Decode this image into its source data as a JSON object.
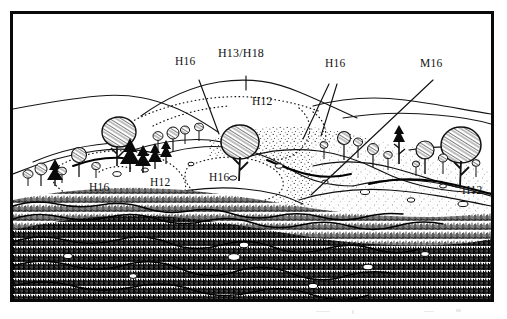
{
  "figure": {
    "kind": "habitat-survey-landscape-sketch",
    "medium": "pen-and-ink line drawing",
    "border_color": "#0a0a0a",
    "ink_color": "#111111",
    "paper_color": "#ffffff"
  },
  "labels": [
    {
      "id": "h16-ridge",
      "text": "H16",
      "x": 175,
      "y": 56,
      "leader": "line-down-right"
    },
    {
      "id": "h13-h18-summit",
      "text": "H13/H18",
      "x": 218,
      "y": 47,
      "leader": "tick-down"
    },
    {
      "id": "h12-upper",
      "text": "H12",
      "x": 252,
      "y": 96,
      "leader": "none"
    },
    {
      "id": "h16-right-pair",
      "text": "H16",
      "x": 325,
      "y": 58,
      "leader": "two-lines-down-left"
    },
    {
      "id": "m16-slope",
      "text": "M16",
      "x": 420,
      "y": 58,
      "leader": "line-down-left"
    },
    {
      "id": "h16-lower-left",
      "text": "H16",
      "x": 89,
      "y": 182,
      "leader": "none"
    },
    {
      "id": "h12-lower-left",
      "text": "H12",
      "x": 150,
      "y": 177,
      "leader": "none"
    },
    {
      "id": "h16-lower-mid",
      "text": "H16",
      "x": 209,
      "y": 172,
      "leader": "none"
    },
    {
      "id": "h12-lower-right",
      "text": "H12",
      "x": 462,
      "y": 185,
      "leader": "none"
    }
  ],
  "legend_codes": [
    {
      "code": "H12",
      "occurrences": 3
    },
    {
      "code": "H13/H18",
      "occurrences": 1
    },
    {
      "code": "H16",
      "occurrences": 4
    },
    {
      "code": "M16",
      "occurrences": 1
    }
  ],
  "scene_elements": {
    "skyline_ridges": 3,
    "dotted_boundaries": 6,
    "deciduous_trees": 9,
    "conifer_trees": 6,
    "shrubs": 12,
    "foreground": "dense stippled and hatched moorland vegetation",
    "midground": "stippled open slopes with dotted habitat boundaries",
    "background": "bare outline hills"
  }
}
